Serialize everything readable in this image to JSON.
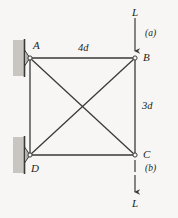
{
  "figure": {
    "type": "truss-free-body-diagram",
    "background_color": "#f7f6f4",
    "line_color": "#3a3a3a",
    "support_fill": "#b8b4b0",
    "wall_fill": "#c9c6c2",
    "nodes": [
      {
        "id": "A",
        "label": "A",
        "x": 30,
        "y": 58,
        "support": "pin-wall-left"
      },
      {
        "id": "B",
        "label": "B",
        "x": 135,
        "y": 58,
        "support": "none"
      },
      {
        "id": "C",
        "label": "C",
        "x": 135,
        "y": 155,
        "support": "none"
      },
      {
        "id": "D",
        "label": "D",
        "x": 30,
        "y": 155,
        "support": "pin-wall-left"
      }
    ],
    "members": [
      {
        "from": "A",
        "to": "B",
        "name": "member-AB"
      },
      {
        "from": "B",
        "to": "C",
        "name": "member-BC"
      },
      {
        "from": "D",
        "to": "C",
        "name": "member-DC"
      },
      {
        "from": "A",
        "to": "D",
        "name": "member-AD"
      },
      {
        "from": "A",
        "to": "C",
        "name": "diagonal-AC"
      },
      {
        "from": "D",
        "to": "B",
        "name": "diagonal-DB"
      }
    ],
    "dimensions": [
      {
        "name": "top-span",
        "label": "4d",
        "x": 78,
        "y": 43
      },
      {
        "name": "right-height",
        "label": "3d",
        "x": 142,
        "y": 101
      }
    ],
    "loads": [
      {
        "name": "load-top",
        "force_label": "L",
        "case_label": "(a)",
        "applied_at": "B",
        "direction": "down",
        "force_label_x": 132,
        "force_label_y": 9,
        "case_label_x": 145,
        "case_label_y": 31
      },
      {
        "name": "load-bottom",
        "force_label": "L",
        "case_label": "(b)",
        "applied_at": "C",
        "direction": "down",
        "force_label_x": 132,
        "force_label_y": 203,
        "case_label_x": 145,
        "case_label_y": 168
      }
    ]
  }
}
